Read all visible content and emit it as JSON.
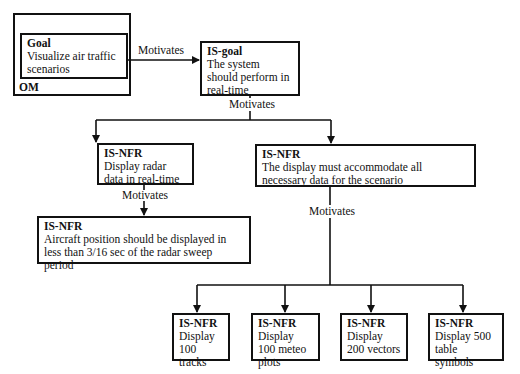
{
  "edge_label": "Motivates",
  "om": {
    "label": "OM",
    "goal": {
      "title": "Goal",
      "text": "Visualize air traffic scenarios"
    }
  },
  "is_goal": {
    "title": "IS-goal",
    "text": "The system should perform in real-time"
  },
  "nfr_radar": {
    "title": "IS-NFR",
    "text": "Display radar data in real-time"
  },
  "nfr_display_all": {
    "title": "IS-NFR",
    "text": "The display must accommodate all necessary data for the scenario"
  },
  "nfr_aircraft": {
    "title": "IS-NFR",
    "text": "Aircraft position should be displayed in less than 3/16 sec of the radar sweep period"
  },
  "leaves": [
    {
      "title": "IS-NFR",
      "text": "Display 100 tracks"
    },
    {
      "title": "IS-NFR",
      "text": "Display 100 meteo plots"
    },
    {
      "title": "IS-NFR",
      "text": "Display 200 vectors"
    },
    {
      "title": "IS-NFR",
      "text": "Display 500 table symbols"
    }
  ],
  "labels": {
    "goal_to_isgoal": "Motivates",
    "isgoal_to_nfrs": "Motivates",
    "radar_to_aircraft": "Motivates",
    "display_to_leaves": "Motivates"
  }
}
